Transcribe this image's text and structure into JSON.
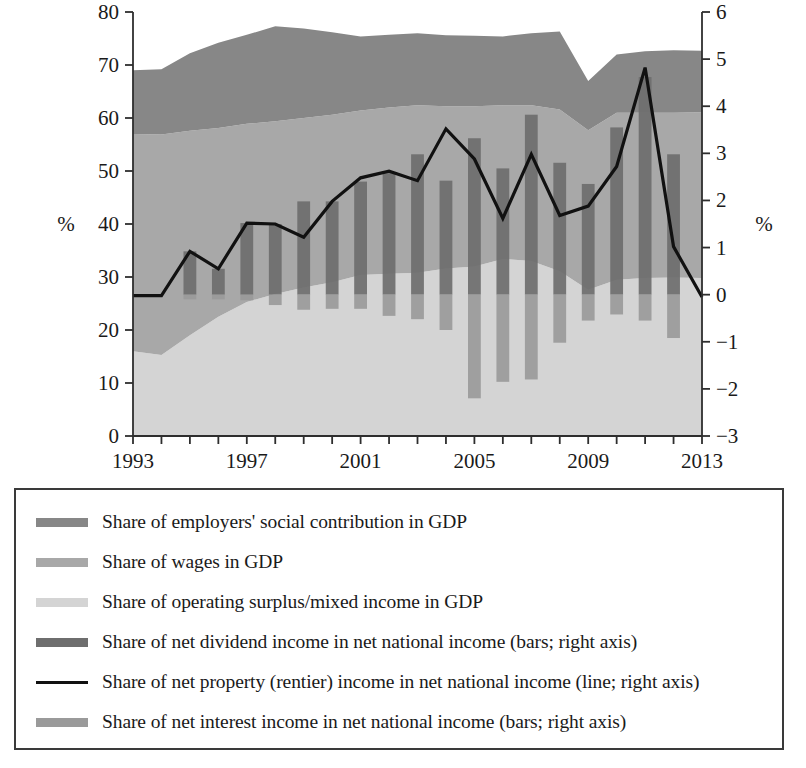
{
  "chart_data": {
    "type": "area",
    "title": "",
    "subtitle": "",
    "xlabel": "",
    "ylabel": "%",
    "ylabel_right": "%",
    "x": [
      1993,
      1994,
      1995,
      1996,
      1997,
      1998,
      1999,
      2000,
      2001,
      2002,
      2003,
      2004,
      2005,
      2006,
      2007,
      2008,
      2009,
      2010,
      2011,
      2012,
      2013
    ],
    "xtick_labels": [
      "1993",
      "1997",
      "2001",
      "2005",
      "2009",
      "2013"
    ],
    "xtick_values": [
      1993,
      1997,
      2001,
      2005,
      2009,
      2013
    ],
    "xlim": [
      1993,
      2013
    ],
    "ylim_left": [
      0,
      80
    ],
    "ytick_left": [
      0,
      10,
      20,
      30,
      40,
      50,
      60,
      70,
      80
    ],
    "ylim_right": [
      -3,
      6
    ],
    "ytick_right": [
      -3,
      -2,
      -1,
      0,
      1,
      2,
      3,
      4,
      5,
      6
    ],
    "grid": false,
    "legend_position": "below-plot",
    "series": [
      {
        "name": "Share of operating surplus/mixed income in GDP",
        "kind": "area-stacked",
        "axis": "left",
        "color": "#d4d4d4",
        "values": [
          16.0,
          15.3,
          19.0,
          22.5,
          25.3,
          26.8,
          28.0,
          29.0,
          30.4,
          30.6,
          30.8,
          31.6,
          32.0,
          33.4,
          33.0,
          31.1,
          27.6,
          29.5,
          29.8,
          29.9,
          29.8
        ]
      },
      {
        "name": "Share of wages in GDP",
        "kind": "area-stacked",
        "axis": "left",
        "color": "#a8a8a8",
        "values": [
          41.0,
          41.6,
          38.6,
          35.6,
          33.6,
          32.6,
          32.0,
          31.6,
          31.0,
          31.4,
          31.6,
          30.6,
          30.2,
          29.0,
          29.4,
          30.5,
          30.1,
          31.5,
          31.2,
          31.1,
          31.3
        ]
      },
      {
        "name": "Share of employers' social contribution in GDP",
        "kind": "area-stacked",
        "axis": "left",
        "color": "#878787",
        "values": [
          12.0,
          12.3,
          14.6,
          16.1,
          16.8,
          17.9,
          16.9,
          15.6,
          14.0,
          13.7,
          13.6,
          13.4,
          13.3,
          13.0,
          13.6,
          14.7,
          9.3,
          11.0,
          11.6,
          11.8,
          11.6
        ]
      },
      {
        "name": "Share of net dividend income in net national income (bars; right axis)",
        "kind": "bar",
        "axis": "right",
        "color": "#6e6e6e",
        "values": [
          0.0,
          0.0,
          0.92,
          0.55,
          1.52,
          1.5,
          1.98,
          1.98,
          2.4,
          2.58,
          2.98,
          2.42,
          3.32,
          2.68,
          3.82,
          2.8,
          2.35,
          3.55,
          4.62,
          2.98,
          0.0
        ]
      },
      {
        "name": "Share of net interest income in net national income (bars; right axis)",
        "kind": "bar",
        "axis": "right",
        "color": "#9a9a9a",
        "values": [
          0.0,
          0.0,
          -0.1,
          -0.1,
          -0.12,
          -0.22,
          -0.32,
          -0.3,
          -0.3,
          -0.45,
          -0.52,
          -0.75,
          -2.2,
          -1.85,
          -1.8,
          -1.02,
          -0.55,
          -0.42,
          -0.55,
          -0.92,
          0.0
        ]
      },
      {
        "name": "Share of net property (rentier) income in net national income (line; right axis)",
        "kind": "line",
        "axis": "right",
        "color": "#111111",
        "values": [
          -0.02,
          -0.02,
          0.92,
          0.55,
          1.52,
          1.5,
          1.22,
          1.98,
          2.48,
          2.62,
          2.42,
          3.52,
          2.88,
          1.62,
          2.98,
          1.68,
          1.88,
          2.72,
          4.82,
          1.02,
          -0.05
        ]
      }
    ]
  },
  "axes": {
    "left_unit": "%",
    "right_unit": "%"
  },
  "legend": {
    "items": [
      {
        "label": "Share of employers' social contribution in GDP",
        "swatch": "#878787",
        "type": "swatch"
      },
      {
        "label": "Share of wages in GDP",
        "swatch": "#a8a8a8",
        "type": "swatch"
      },
      {
        "label": "Share of operating surplus/mixed income in GDP",
        "swatch": "#d4d4d4",
        "type": "swatch"
      },
      {
        "label": "Share of net dividend income in net national income (bars; right axis)",
        "swatch": "#6e6e6e",
        "type": "swatch"
      },
      {
        "label": "Share of net property (rentier) income in net national income (line; right axis)",
        "swatch": "#111111",
        "type": "line"
      },
      {
        "label": "Share of net interest income in net national income (bars; right axis)",
        "swatch": "#9a9a9a",
        "type": "swatch"
      }
    ]
  }
}
